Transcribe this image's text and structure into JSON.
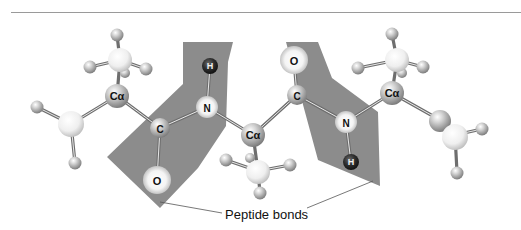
{
  "figure": {
    "caption": "Peptide bonds",
    "atom_labels": {
      "c_alpha": "Cα",
      "carbon": "C",
      "nitrogen": "N",
      "oxygen": "O",
      "hydrogen": "H"
    },
    "colors": {
      "plane_fill": "#8c8c8c",
      "atom_gray": "#bdbdbd",
      "atom_light": "#f1f1f1",
      "hydrogen_dark": "#2a2a2a",
      "bond": "#777777",
      "divider": "#9a9a9a"
    }
  }
}
